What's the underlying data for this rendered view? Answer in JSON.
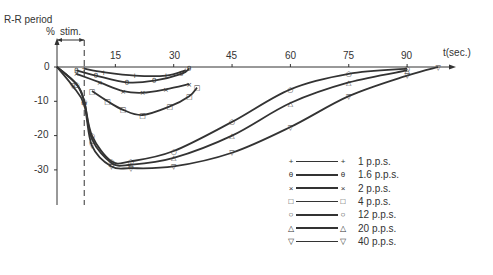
{
  "chart_data": {
    "type": "line",
    "title": "",
    "ylabel": "R-R period %",
    "xlabel": "t(sec.)",
    "annotation": "stim.",
    "stim_period": [
      0,
      7
    ],
    "x_ticks": [
      15,
      30,
      45,
      60,
      75,
      90
    ],
    "y_ticks": [
      0,
      -10,
      -20,
      -30
    ],
    "y_tick_labels": [
      "0",
      "-10",
      "-20",
      "-30"
    ],
    "xlim": [
      0,
      100
    ],
    "ylim": [
      -38,
      0
    ],
    "grid": false,
    "legend_position": "lower right",
    "series": [
      {
        "name": "1 p.p.s.",
        "marker": "+",
        "points": [
          [
            7,
            -0.5
          ],
          [
            12,
            -1.5
          ],
          [
            20,
            -2.5
          ],
          [
            28,
            -2.5
          ],
          [
            33,
            -1
          ]
        ]
      },
      {
        "name": "1.6 p.p.s.",
        "marker": "θ",
        "points": [
          [
            5,
            -1
          ],
          [
            10,
            -2.5
          ],
          [
            18,
            -4.5
          ],
          [
            25,
            -4
          ],
          [
            32,
            -2
          ],
          [
            34,
            -0.5
          ]
        ]
      },
      {
        "name": "2 p.p.s.",
        "marker": "x",
        "points": [
          [
            5,
            -2
          ],
          [
            11,
            -4.5
          ],
          [
            17,
            -7
          ],
          [
            22,
            -7.5
          ],
          [
            28,
            -6.5
          ],
          [
            34,
            -5
          ]
        ]
      },
      {
        "name": "4 p.p.s.",
        "marker": "□",
        "points": [
          [
            9,
            -7
          ],
          [
            13,
            -10
          ],
          [
            17,
            -12.5
          ],
          [
            22,
            -14
          ],
          [
            29,
            -11.5
          ],
          [
            34,
            -8.5
          ],
          [
            36,
            -6
          ]
        ]
      },
      {
        "name": "12 p.p.s.",
        "marker": "○",
        "points": [
          [
            0,
            0
          ],
          [
            5,
            -5
          ],
          [
            7,
            -10
          ],
          [
            9,
            -20
          ],
          [
            14,
            -27.5
          ],
          [
            19,
            -27.5
          ],
          [
            30,
            -24.5
          ],
          [
            45,
            -16
          ],
          [
            60,
            -6.5
          ],
          [
            75,
            -2
          ],
          [
            90,
            -0.5
          ]
        ]
      },
      {
        "name": "20 p.p.s.",
        "marker": "△",
        "points": [
          [
            0,
            0
          ],
          [
            5,
            -5
          ],
          [
            7,
            -10
          ],
          [
            9,
            -21
          ],
          [
            14,
            -28
          ],
          [
            19,
            -28.5
          ],
          [
            30,
            -26.5
          ],
          [
            45,
            -20
          ],
          [
            60,
            -10.5
          ],
          [
            75,
            -4.5
          ],
          [
            90,
            -1
          ]
        ]
      },
      {
        "name": "40 p.p.s.",
        "marker": "▽",
        "points": [
          [
            0,
            0
          ],
          [
            4,
            -5.5
          ],
          [
            7,
            -11
          ],
          [
            9,
            -23
          ],
          [
            14,
            -29
          ],
          [
            19,
            -29.5
          ],
          [
            30,
            -29
          ],
          [
            45,
            -25
          ],
          [
            60,
            -17.5
          ],
          [
            75,
            -8.5
          ],
          [
            90,
            -2.5
          ],
          [
            98,
            0
          ]
        ]
      }
    ]
  },
  "labels": {
    "y_title": "R-R period",
    "y_unit": "%",
    "stim": "stim.",
    "x_title": "t(sec.)"
  },
  "legend": [
    {
      "sym": "+",
      "label": "1 p.p.s."
    },
    {
      "sym": "θ",
      "label": "1.6 p.p.s."
    },
    {
      "sym": "×",
      "label": "2 p.p.s."
    },
    {
      "sym": "□",
      "label": "4 p.p.s."
    },
    {
      "sym": "○",
      "label": "12 p.p.s."
    },
    {
      "sym": "△",
      "label": "20 p.p.s."
    },
    {
      "sym": "▽",
      "label": "40 p.p.s."
    }
  ],
  "ticks": {
    "x": [
      "15",
      "30",
      "45",
      "60",
      "75",
      "90"
    ],
    "y": [
      "0",
      "-10",
      "-20",
      "-30"
    ]
  }
}
